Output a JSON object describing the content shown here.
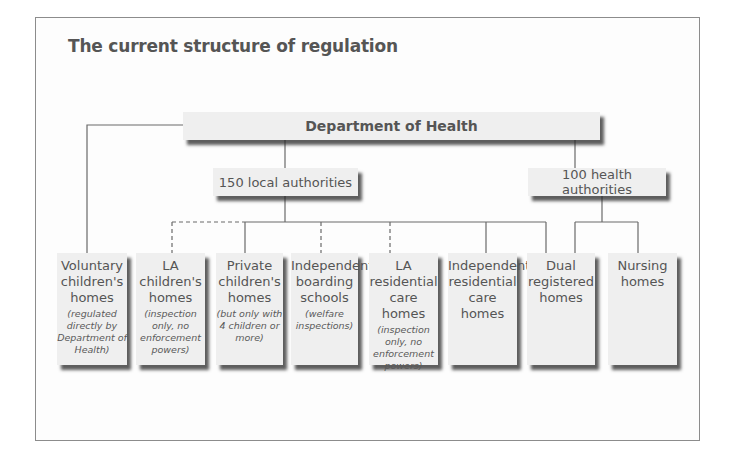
{
  "title": "The current structure of regulation",
  "top": {
    "label": "Department of Health"
  },
  "mid": [
    {
      "label": "150 local authorities"
    },
    {
      "label": "100 health authorities"
    }
  ],
  "leaves": [
    {
      "name": "Voluntary children's homes",
      "note": "(regulated directly by Department of Health)",
      "parent": "Department of Health",
      "link": "solid"
    },
    {
      "name": "LA children's homes",
      "note": "(inspection only, no enforcement powers)",
      "parent": "150 local authorities",
      "link": "dashed"
    },
    {
      "name": "Private children's homes",
      "note": "(but only with 4 children or more)",
      "parent": "150 local authorities",
      "link": "solid"
    },
    {
      "name": "Independent boarding schools",
      "note": "(welfare inspections)",
      "parent": "150 local authorities",
      "link": "dashed"
    },
    {
      "name": "LA residential care homes",
      "note": "(inspection only, no enforcement powers)",
      "parent": "150 local authorities",
      "link": "dashed"
    },
    {
      "name": "Independent residential care homes",
      "note": "",
      "parent": "150 local authorities",
      "link": "solid"
    },
    {
      "name": "Dual registered homes",
      "note": "",
      "parent": "150 local authorities + 100 health authorities",
      "link": "solid"
    },
    {
      "name": "Nursing homes",
      "note": "",
      "parent": "100 health authorities",
      "link": "solid"
    }
  ],
  "colors": {
    "box_fill": "#efefef",
    "shadow": "#333333",
    "line": "#6a6a6a",
    "text": "#555555"
  }
}
